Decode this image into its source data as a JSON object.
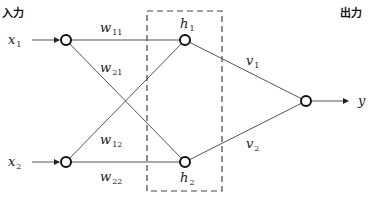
{
  "labels": {
    "input_heading": "入力",
    "output_heading": "出力"
  },
  "inputs": [
    {
      "var": "x",
      "sub": "1"
    },
    {
      "var": "x",
      "sub": "2"
    }
  ],
  "hidden": [
    {
      "var": "h",
      "sub": "1"
    },
    {
      "var": "h",
      "sub": "2"
    }
  ],
  "output": {
    "var": "y"
  },
  "weights_input_hidden": [
    {
      "var": "w",
      "sub": "11"
    },
    {
      "var": "w",
      "sub": "21"
    },
    {
      "var": "w",
      "sub": "12"
    },
    {
      "var": "w",
      "sub": "22"
    }
  ],
  "weights_hidden_output": [
    {
      "var": "v",
      "sub": "1"
    },
    {
      "var": "v",
      "sub": "2"
    }
  ]
}
